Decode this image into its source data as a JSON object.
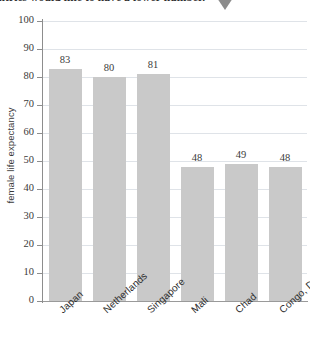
{
  "caption": {
    "text": "untries would like to have a lower number."
  },
  "marker": {
    "name": "down-triangle-marker",
    "color": "#8c8c8c"
  },
  "chart_data": {
    "type": "bar",
    "title": "",
    "subtitle": "",
    "xlabel": "",
    "ylabel": "female life expectancy",
    "categories": [
      "Japan",
      "Netherlands",
      "Singapore",
      "Mali",
      "Chad",
      "Congo, DR"
    ],
    "values": [
      83,
      80,
      81,
      48,
      49,
      48
    ],
    "data_labels": [
      "83",
      "80",
      "81",
      "48",
      "49",
      "48"
    ],
    "ylim": [
      0,
      100
    ],
    "yticks": [
      0,
      10,
      20,
      30,
      40,
      50,
      60,
      70,
      80,
      90,
      100
    ],
    "ytick_labels": [
      "0",
      "10",
      "20",
      "30",
      "40",
      "50",
      "60",
      "70",
      "80",
      "90",
      "100"
    ],
    "grid": true,
    "legend": null,
    "bar_color": "#c9c9c9",
    "grid_color": "#dfe3e8",
    "axis_color": "#8d8d8d"
  }
}
